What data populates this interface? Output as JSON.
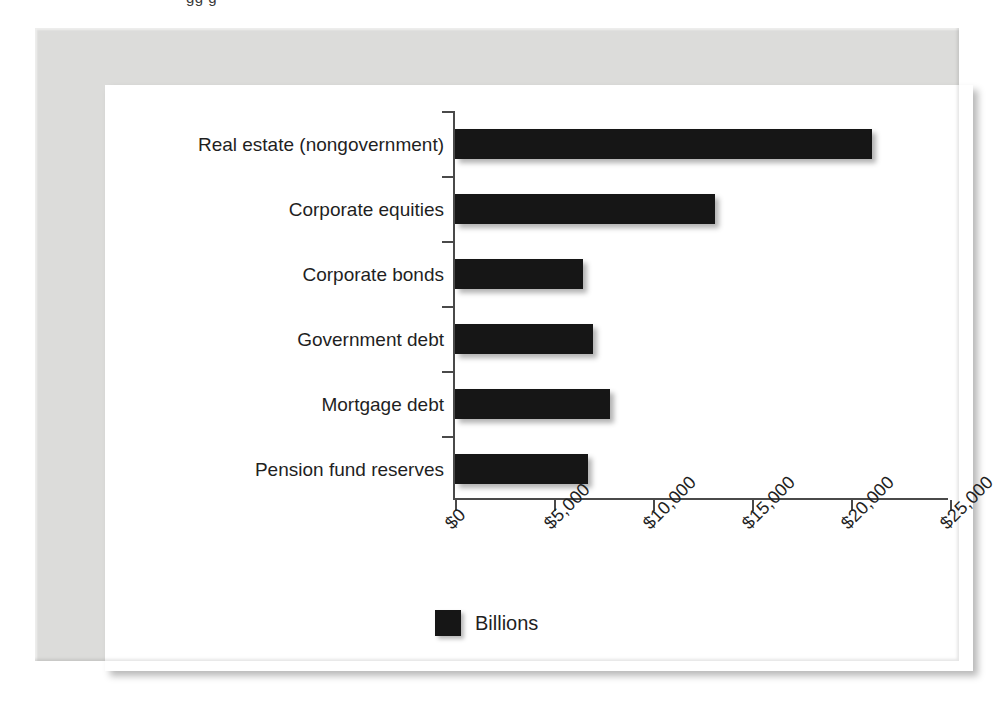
{
  "clipped_caption": "gg  g",
  "colors": {
    "bar": "#161616",
    "axis": "#4a4a4a",
    "card": "#ffffff",
    "frame": "#dcdcda",
    "text": "#1f1f1f"
  },
  "legend": {
    "label": "Billions",
    "swatch_color": "#161616",
    "position": "bottom-center"
  },
  "chart_data": {
    "type": "bar",
    "orientation": "horizontal",
    "title": "",
    "subtitle": "",
    "xlabel": "",
    "ylabel": "",
    "categories": [
      "Real estate (nongovernment)",
      "Corporate equities",
      "Corporate bonds",
      "Government debt",
      "Mortgage debt",
      "Pension fund reserves"
    ],
    "values": [
      21070,
      13150,
      6450,
      6950,
      7820,
      6700
    ],
    "series": [
      {
        "name": "Billions",
        "values": [
          21070,
          13150,
          6450,
          6950,
          7820,
          6700
        ]
      }
    ],
    "xlim": [
      0,
      25000
    ],
    "xticks": [
      0,
      5000,
      10000,
      15000,
      20000,
      25000
    ],
    "xticklabels": [
      "$0",
      "$5,000",
      "$10,000",
      "$15,000",
      "$20,000",
      "$25,000"
    ],
    "xtick_rotation": -45,
    "grid": false,
    "units": "Billions of dollars",
    "legend_entries": [
      "Billions"
    ]
  }
}
